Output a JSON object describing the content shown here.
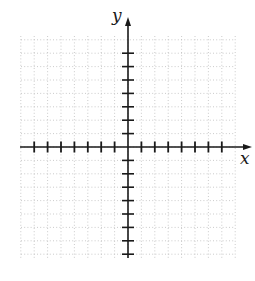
{
  "diagram": {
    "type": "coordinate-plane",
    "axis_labels": {
      "x": "x",
      "y": "y"
    },
    "origin_px": {
      "x": 128,
      "y": 147
    },
    "unit_px": 13.4,
    "x_ticks": {
      "min": -7,
      "max": 7
    },
    "y_ticks": {
      "min": -8,
      "max": 7
    },
    "grid": {
      "style": "dotted",
      "left": 21,
      "right": 235,
      "top": 36,
      "bottom": 258
    },
    "colors": {
      "axis": "#1a1a1a",
      "grid": "#b5b5b5",
      "background": "#ffffff"
    }
  }
}
